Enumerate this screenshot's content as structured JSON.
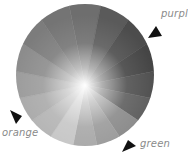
{
  "diagram": {
    "title": "",
    "wheel": {
      "segments": 16,
      "center_color": "#ffffff",
      "segment_grays": [
        "#6e6e6e",
        "#5a5a5a",
        "#4c4c4c",
        "#454545",
        "#505050",
        "#5e5e5e",
        "#8a8a8a",
        "#9a9a9a",
        "#a8a8a8",
        "#c6c6c6",
        "#b4b4b4",
        "#aaaaaa",
        "#9c9c9c",
        "#8c8c8c",
        "#7c7c7c",
        "#747474"
      ]
    },
    "labels": [
      {
        "id": "purple",
        "text": "purple"
      },
      {
        "id": "orange",
        "text": "orange"
      },
      {
        "id": "green",
        "text": "green"
      }
    ]
  }
}
